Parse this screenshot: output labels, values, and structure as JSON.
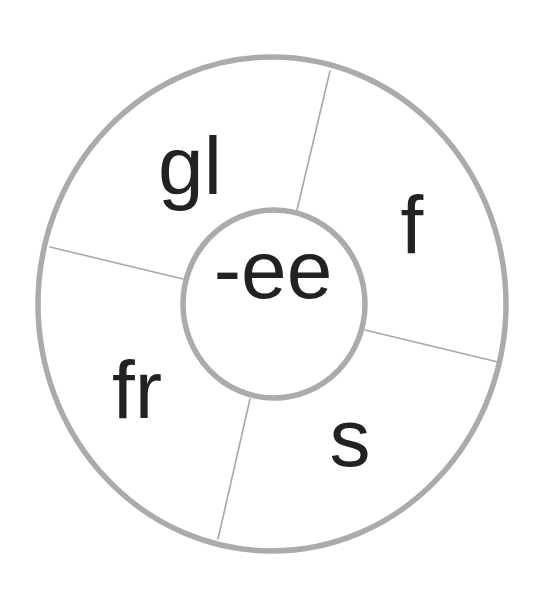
{
  "wheel": {
    "title": "word wheel",
    "center_label": "-ee",
    "segments": [
      {
        "id": "top-left",
        "label": "gl"
      },
      {
        "id": "top-right",
        "label": "f"
      },
      {
        "id": "bottom-right",
        "label": "s"
      },
      {
        "id": "bottom-left",
        "label": "fr"
      }
    ]
  },
  "colors": {
    "ring_stroke": "#ababab",
    "divider_stroke": "#a8a8a8",
    "text": "#222222",
    "background": "#ffffff"
  }
}
